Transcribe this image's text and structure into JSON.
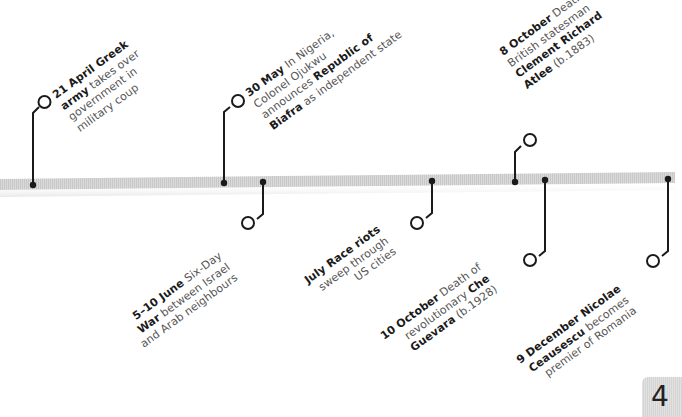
{
  "timeline": {
    "year_page": "4",
    "bar_color": "#d2d2d2",
    "marker_color": "#1a1a1a",
    "text_color": "#555555",
    "bold_color": "#1a1a1a",
    "events_above": [
      {
        "id": "21-april",
        "lines": [
          [
            {
              "t": "21 April ",
              "b": true
            },
            {
              "t": "Greek",
              "b": true
            }
          ],
          [
            {
              "t": "army",
              "b": true
            },
            {
              "t": " takes over",
              "b": false
            }
          ],
          [
            {
              "t": "government in",
              "b": false
            }
          ],
          [
            {
              "t": "military coup",
              "b": false
            }
          ]
        ]
      },
      {
        "id": "30-may",
        "lines": [
          [
            {
              "t": "30 May",
              "b": true
            },
            {
              "t": " In Nigeria,",
              "b": false
            }
          ],
          [
            {
              "t": "Colonel Ojukwu",
              "b": false
            }
          ],
          [
            {
              "t": "announces ",
              "b": false
            },
            {
              "t": "Republic of",
              "b": true
            }
          ],
          [
            {
              "t": "Biafra",
              "b": true
            },
            {
              "t": " as independent state",
              "b": false
            }
          ]
        ]
      },
      {
        "id": "8-october",
        "lines": [
          [
            {
              "t": "8 October",
              "b": true
            },
            {
              "t": " Death of",
              "b": false
            }
          ],
          [
            {
              "t": "British statesman",
              "b": false
            }
          ],
          [
            {
              "t": "Clement Richard",
              "b": true
            }
          ],
          [
            {
              "t": "Atlee",
              "b": true
            },
            {
              "t": " (b.1883)",
              "b": false
            }
          ]
        ]
      }
    ],
    "events_below": [
      {
        "id": "5-10-june",
        "lines": [
          [
            {
              "t": "5–10 June",
              "b": true
            },
            {
              "t": " Six-Day",
              "b": false
            }
          ],
          [
            {
              "t": "War",
              "b": true
            },
            {
              "t": " between Israel",
              "b": false
            }
          ],
          [
            {
              "t": "and Arab neighbours",
              "b": false
            }
          ]
        ]
      },
      {
        "id": "july",
        "lines": [
          [
            {
              "t": "July",
              "b": true
            },
            {
              "t": " Race riots",
              "b": true
            }
          ],
          [
            {
              "t": "sweep through",
              "b": false
            }
          ],
          [
            {
              "t": "US cities",
              "b": false
            }
          ]
        ]
      },
      {
        "id": "10-october",
        "lines": [
          [
            {
              "t": "10 October",
              "b": true
            },
            {
              "t": " Death of",
              "b": false
            }
          ],
          [
            {
              "t": "revolutionary ",
              "b": false
            },
            {
              "t": "Che",
              "b": true
            }
          ],
          [
            {
              "t": "Guevara",
              "b": true
            },
            {
              "t": " (b.1928)",
              "b": false
            }
          ]
        ]
      },
      {
        "id": "9-december",
        "lines": [
          [
            {
              "t": "9 December",
              "b": true
            },
            {
              "t": " Nicolae",
              "b": true
            }
          ],
          [
            {
              "t": "Ceausescu",
              "b": true
            },
            {
              "t": " becomes",
              "b": false
            }
          ],
          [
            {
              "t": "premier of Romania",
              "b": false
            }
          ]
        ]
      }
    ]
  }
}
